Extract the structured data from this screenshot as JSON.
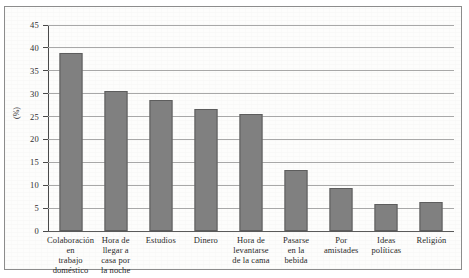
{
  "chart_data": {
    "type": "bar",
    "title": "",
    "subtitle": "",
    "xlabel": "",
    "ylabel": "(%)",
    "ylim": [
      0,
      45
    ],
    "ytick_step": 5,
    "yticks": [
      "45",
      "40",
      "35",
      "30",
      "25",
      "20",
      "15",
      "10",
      "5",
      "0"
    ],
    "grid": true,
    "legend": false,
    "legend_position": "none",
    "bar_color": "#808080",
    "bar_edge_color": "#5d5d5d",
    "grid_color": "#a8a8a8",
    "axis_color": "#4a4a4a",
    "categories": [
      "Colaboración en trabajo doméstico",
      "Hora de llegar a casa por la noche",
      "Estudios",
      "Dinero",
      "Hora de levantarse de la cama",
      "Pasarse en la bebida",
      "Por amistades",
      "Ideas políticas",
      "Religión"
    ],
    "category_lines": [
      [
        "Colaboración",
        "en",
        "trabajo",
        "doméstico"
      ],
      [
        "Hora de",
        "llegar a",
        "casa por",
        "la noche"
      ],
      [
        "Estudios"
      ],
      [
        "Dinero"
      ],
      [
        "Hora de",
        "levantarse",
        "de la cama"
      ],
      [
        "Pasarse",
        "en la",
        "bebida"
      ],
      [
        "Por",
        "amistades"
      ],
      [
        "Ideas",
        "políticas"
      ],
      [
        "Religión"
      ]
    ],
    "values": [
      38.8,
      30.5,
      28.6,
      26.7,
      25.5,
      13.3,
      9.3,
      5.8,
      6.3
    ]
  }
}
